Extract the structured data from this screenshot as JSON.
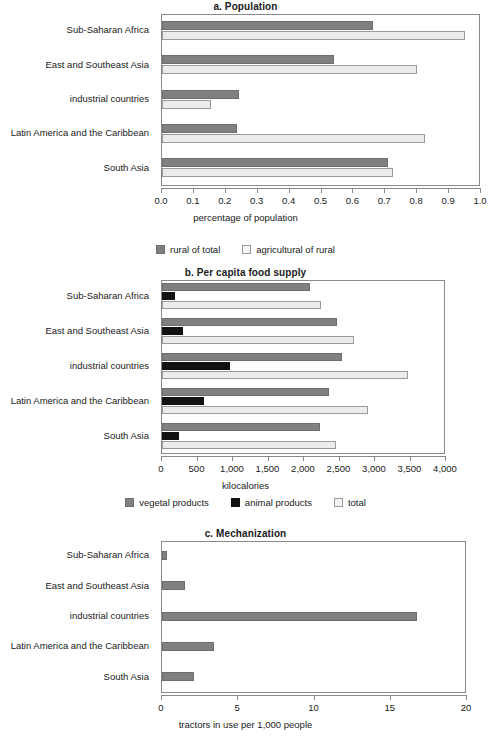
{
  "chart_data": [
    {
      "id": "a",
      "type": "bar",
      "orientation": "horizontal",
      "title": "a. Population",
      "xlabel": "percentage of population",
      "ylabel": "",
      "xlim": [
        0.0,
        1.0
      ],
      "xticks": [
        "0.0",
        "0.1",
        "0.2",
        "0.3",
        "0.4",
        "0.5",
        "0.6",
        "0.7",
        "0.8",
        "0.9",
        "1.0"
      ],
      "xtick_values": [
        0.0,
        0.1,
        0.2,
        0.3,
        0.4,
        0.5,
        0.6,
        0.7,
        0.8,
        0.9,
        1.0
      ],
      "grid": false,
      "legend_position": "bottom",
      "categories": [
        "Sub-Saharan Africa",
        "East and Southeast Asia",
        "industrial countries",
        "Latin America and the Caribbean",
        "South Asia"
      ],
      "series": [
        {
          "name": "rural of total",
          "color": "#808080",
          "values": [
            0.66,
            0.54,
            0.24,
            0.235,
            0.71
          ]
        },
        {
          "name": "agricultural of rural",
          "color": "#ececec",
          "values": [
            0.95,
            0.8,
            0.155,
            0.825,
            0.725
          ]
        }
      ]
    },
    {
      "id": "b",
      "type": "bar",
      "orientation": "horizontal",
      "title": "b. Per capita food supply",
      "xlabel": "kilocalories",
      "ylabel": "",
      "xlim": [
        0,
        4000
      ],
      "xticks": [
        "0",
        "500",
        "1,000",
        "1,500",
        "2,000",
        "2,500",
        "3,000",
        "3,500",
        "4,000"
      ],
      "xtick_values": [
        0,
        500,
        1000,
        1500,
        2000,
        2500,
        3000,
        3500,
        4000
      ],
      "grid": false,
      "legend_position": "bottom",
      "categories": [
        "Sub-Saharan Africa",
        "East and Southeast Asia",
        "industrial countries",
        "Latin America and the Caribbean",
        "South Asia"
      ],
      "series": [
        {
          "name": "vegetal products",
          "color": "#808080",
          "values": [
            2080,
            2460,
            2530,
            2350,
            2220
          ]
        },
        {
          "name": "animal products",
          "color": "#121212",
          "values": [
            190,
            290,
            960,
            590,
            240
          ]
        },
        {
          "name": "total",
          "color": "#ececec",
          "values": [
            2240,
            2700,
            3470,
            2900,
            2450
          ]
        }
      ]
    },
    {
      "id": "c",
      "type": "bar",
      "orientation": "horizontal",
      "title": "c. Mechanization",
      "xlabel": "tractors in use per 1,000 people",
      "ylabel": "",
      "xlim": [
        0,
        20
      ],
      "xticks": [
        "0",
        "5",
        "10",
        "15",
        "20"
      ],
      "xtick_values": [
        0,
        5,
        10,
        15,
        20
      ],
      "grid": false,
      "legend_position": "none",
      "categories": [
        "Sub-Saharan Africa",
        "East and Southeast Asia",
        "industrial countries",
        "Latin America and the Caribbean",
        "South Asia"
      ],
      "series": [
        {
          "name": "tractors",
          "color": "#808080",
          "values": [
            0.35,
            1.5,
            16.7,
            3.4,
            2.1
          ]
        }
      ]
    }
  ]
}
